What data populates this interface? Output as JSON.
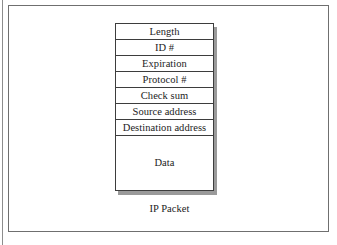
{
  "figure": {
    "caption": "IP Packet",
    "diagram_title": "IP Packet",
    "colors": {
      "page_background": "#ffffff",
      "frame_border": "#6f6f6f",
      "box_border": "#3d3d3d",
      "box_fill": "#ffffff",
      "shadow": "#9a9a9a",
      "text": "#1c1c1c"
    }
  },
  "packet": {
    "name": "IP Packet",
    "fields": [
      {
        "label": "Length"
      },
      {
        "label": "ID #"
      },
      {
        "label": "Expiration"
      },
      {
        "label": "Protocol #"
      },
      {
        "label": "Check sum"
      },
      {
        "label": "Source address"
      },
      {
        "label": "Destination address"
      },
      {
        "label": "Data"
      }
    ]
  }
}
